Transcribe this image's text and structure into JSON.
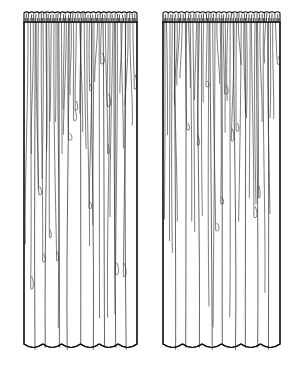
{
  "illustration": {
    "title": "Two gathered sheer curtain panels",
    "subject": "curtain-panel-pair",
    "style": "black-and-white line drawing",
    "background_color": "#ffffff",
    "line_color": "#0d0d0d",
    "drape_line_color": "#2b2b2b",
    "canvas": {
      "width": 300,
      "height": 373
    },
    "panels": [
      {
        "name": "left-curtain-panel",
        "label": "Left panel",
        "x": 24,
        "y": 12,
        "width": 113,
        "height": 338,
        "header": {
          "name": "shirred-header-band",
          "label": "Gathered rod-pocket header",
          "top": 12,
          "bottom": 22,
          "gather_tick_count": 46,
          "scallop_count": 22
        },
        "hem": {
          "name": "scalloped-hem",
          "label": "Scalloped bottom hem",
          "y": 344,
          "wave_count": 6,
          "wave_depth": 7
        },
        "drape_lines": 44,
        "full_length_folds": 9
      },
      {
        "name": "right-curtain-panel",
        "label": "Right panel",
        "x": 163,
        "y": 12,
        "width": 117,
        "height": 338,
        "header": {
          "name": "shirred-header-band",
          "label": "Gathered rod-pocket header",
          "top": 12,
          "bottom": 22,
          "gather_tick_count": 46,
          "scallop_count": 22
        },
        "hem": {
          "name": "scalloped-hem",
          "label": "Scalloped bottom hem",
          "y": 344,
          "wave_count": 6,
          "wave_depth": 7
        },
        "drape_lines": 44,
        "full_length_folds": 9
      }
    ]
  }
}
